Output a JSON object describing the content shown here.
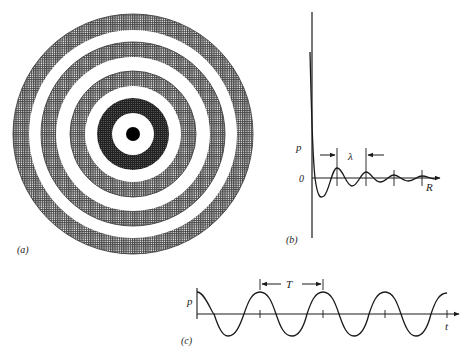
{
  "figure": {
    "panel_a": {
      "label": "(a)",
      "description": "Concentric rings pattern: central black dot, white ring, dark ring, then alternating white and stippled rings",
      "center": [
        133,
        134
      ],
      "rings": [
        {
          "r": 120,
          "fill": "stipple"
        },
        {
          "r": 104,
          "fill": "white"
        },
        {
          "r": 92,
          "fill": "stipple"
        },
        {
          "r": 77,
          "fill": "white"
        },
        {
          "r": 63,
          "fill": "stipple"
        },
        {
          "r": 48,
          "fill": "white"
        },
        {
          "r": 36,
          "fill": "dark"
        },
        {
          "r": 21,
          "fill": "white"
        },
        {
          "r": 7,
          "fill": "black"
        }
      ]
    },
    "panel_b": {
      "label": "(b)",
      "y_axis_label": "p",
      "zero_label": "0",
      "x_axis_label": "R",
      "wavelength_label": "λ",
      "tick_x": [
        337,
        366,
        394,
        422
      ]
    },
    "panel_c": {
      "label": "(c)",
      "y_axis_label": "p",
      "x_axis_label": "t",
      "period_label": "T",
      "tick_x": [
        260,
        323,
        385,
        447
      ]
    }
  },
  "colors": {
    "ink": "#1a1a1a",
    "stipple": "#555555",
    "background": "#ffffff"
  }
}
